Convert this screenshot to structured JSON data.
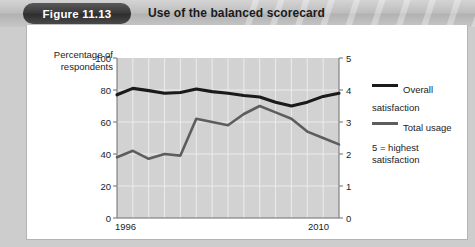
{
  "header": {
    "badge_label": "Figure 11.13",
    "title": "Use of the balanced scorecard"
  },
  "axes": {
    "y_left_title": "Percentage of\nrespondents",
    "y_left_ticks": [
      "100",
      "80",
      "60",
      "40",
      "20",
      "0"
    ],
    "y_right_ticks": [
      "5",
      "4",
      "3",
      "2",
      "1",
      "0"
    ],
    "x_label_start": "1996",
    "x_label_end": "2010"
  },
  "legend": {
    "items": [
      {
        "label": "Overall\nsatisfaction",
        "color": "#1a1a1a"
      },
      {
        "label": "Total usage",
        "color": "#5d5d5d"
      }
    ],
    "note": "5 = highest\n    satisfaction"
  },
  "colors": {
    "plot_background": "#d2d2d2",
    "gridline": "#ececec",
    "axis": "#6f6f6f",
    "overall_satisfaction": "#1a1a1a",
    "total_usage": "#5d5d5d",
    "panel_background": "#ffffff",
    "header_band": "#bdbdbd",
    "badge": "#3b3b3b"
  },
  "chart_data": {
    "type": "line",
    "title": "Use of the balanced scorecard",
    "xlabel": "",
    "ylabel": "Percentage of respondents",
    "y2label": "Satisfaction (5 = highest satisfaction)",
    "x": [
      1996,
      1997,
      1998,
      1999,
      2000,
      2001,
      2002,
      2003,
      2004,
      2005,
      2006,
      2007,
      2008,
      2009,
      2010
    ],
    "xlim": [
      1996,
      2010
    ],
    "ylim": [
      0,
      100
    ],
    "y2lim": [
      0,
      5
    ],
    "grid": true,
    "legend_position": "right",
    "series": [
      {
        "name": "Overall satisfaction",
        "axis": "right",
        "color": "#1a1a1a",
        "values": [
          3.85,
          4.05,
          3.98,
          3.9,
          3.92,
          4.03,
          3.95,
          3.9,
          3.83,
          3.78,
          3.62,
          3.5,
          3.62,
          3.8,
          3.9
        ]
      },
      {
        "name": "Total usage",
        "axis": "left",
        "color": "#5d5d5d",
        "values": [
          38,
          42,
          37,
          40,
          39,
          62,
          60,
          58,
          65,
          70,
          66,
          62,
          54,
          50,
          46
        ]
      }
    ],
    "annotations": [
      "5 = highest satisfaction"
    ]
  }
}
